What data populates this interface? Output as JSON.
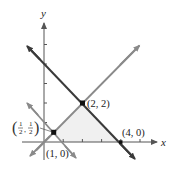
{
  "diagram": {
    "type": "linear-inequality-region",
    "axes": {
      "x_label": "x",
      "y_label": "y"
    },
    "lines": [
      {
        "name": "y = x",
        "color": "#8a8a8a"
      },
      {
        "name": "x + y = 4",
        "color": "#3a3a3a"
      },
      {
        "name": "x + y = 1",
        "color": "#8a8a8a"
      }
    ],
    "points": [
      {
        "label": "(2, 2)",
        "x": 2,
        "y": 2
      },
      {
        "label": "(4, 0)",
        "x": 4,
        "y": 0
      },
      {
        "label": "(1, 0)",
        "x": 1,
        "y": 0
      },
      {
        "label_num_x": "1",
        "label_den_x": "2",
        "label_num_y": "1",
        "label_den_y": "2",
        "x": 0.5,
        "y": 0.5
      }
    ],
    "shaded_region": {
      "vertices": [
        "(1/2, 1/2)",
        "(2, 2)",
        "(4, 0)",
        "(1, 0)"
      ],
      "color": "#f0f0f0"
    }
  }
}
